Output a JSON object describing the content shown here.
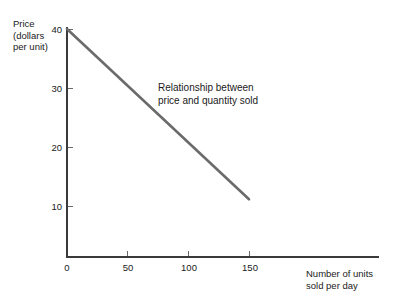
{
  "chart_data": {
    "type": "line",
    "title": "",
    "xlabel": "Number of units\nsold per day",
    "ylabel": "Price\n(dollars\nper unit)",
    "annotation": "Relationship between\nprice and quantity sold",
    "x": [
      0,
      150
    ],
    "values": [
      40,
      10
    ],
    "series": [
      {
        "name": "Relationship between price and quantity sold",
        "points": [
          {
            "x": 0,
            "y": 40
          },
          {
            "x": 150,
            "y": 10
          }
        ]
      }
    ],
    "xlim": [
      0,
      200
    ],
    "ylim": [
      0,
      42
    ],
    "xticks": [
      0,
      50,
      100,
      150
    ],
    "yticks": [
      10,
      20,
      30,
      40
    ],
    "xtick_labels": [
      "0",
      "50",
      "100",
      "150"
    ],
    "ytick_labels": [
      "10",
      "20",
      "30",
      "40"
    ],
    "grid": false,
    "legend": false,
    "line_color": "#6b6b6b",
    "axis_color": "#3a3a3a",
    "background": "#ffffff"
  },
  "axes": {
    "y_title": "Price\n(dollars\nper unit)",
    "x_title": "Number of units\nsold per day"
  },
  "annotation": {
    "text": "Relationship between\nprice and quantity sold"
  },
  "ticks": {
    "y": [
      {
        "label": "40",
        "top": 24
      },
      {
        "label": "30",
        "top": 83
      },
      {
        "label": "20",
        "top": 142
      },
      {
        "label": "10",
        "top": 201
      }
    ],
    "x": [
      {
        "label": "0",
        "left": 52
      },
      {
        "label": "50",
        "left": 113
      },
      {
        "label": "100",
        "left": 174
      },
      {
        "label": "150",
        "left": 235
      }
    ]
  }
}
